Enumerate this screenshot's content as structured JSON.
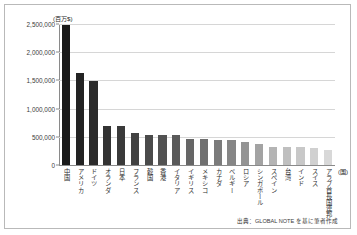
{
  "chart_data": {
    "type": "bar",
    "title": "",
    "subtitle": "",
    "xlabel": "(国)",
    "ylabel": "(百万$)",
    "ylim": [
      0,
      2500000
    ],
    "grid": true,
    "legend": false,
    "ytick_labels": [
      "2,500,000",
      "2,000,000",
      "1,500,000",
      "1,000,000",
      "500,000",
      "0"
    ],
    "ytick_values": [
      2500000,
      2000000,
      1500000,
      1000000,
      500000,
      0
    ],
    "categories": [
      "中国",
      "アメリカ",
      "ドイツ",
      "オランダ",
      "日本",
      "フランス",
      "韓国",
      "香港",
      "イタリア",
      "イギリス",
      "メキシコ",
      "カナダ",
      "ベルギー",
      "ロシア",
      "シンガポール",
      "スペイン",
      "台湾",
      "インド",
      "スイス",
      "アラブ首長国連邦"
    ],
    "values": [
      2490000,
      1640000,
      1490000,
      700000,
      695000,
      565000,
      540000,
      530000,
      525000,
      465000,
      460000,
      440000,
      435000,
      405000,
      375000,
      320000,
      318000,
      315000,
      300000,
      270000
    ],
    "bar_colors": [
      "#1a1a1a",
      "#232323",
      "#2b2b2b",
      "#333333",
      "#3a3a3a",
      "#424242",
      "#4a4a4a",
      "#525252",
      "#5a5a5a",
      "#666666",
      "#707070",
      "#7b7b7b",
      "#868686",
      "#949494",
      "#a3a3a3",
      "#b4b4b4",
      "#bfbfbf",
      "#c8c8c8",
      "#d0d0d0",
      "#d8d8d8"
    ]
  },
  "source_note": "出典：GLOBAL NOTE を基に筆者作成",
  "colors": {
    "frame": "#b9b9b9",
    "gridline": "#d6d6d6",
    "axis": "#8a8a8a",
    "text": "#2b2b2b"
  }
}
